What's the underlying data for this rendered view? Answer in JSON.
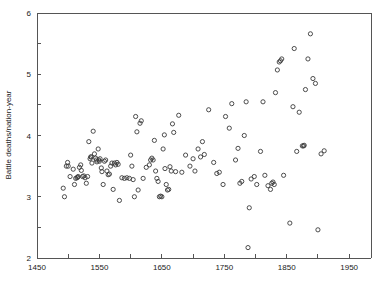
{
  "figure": {
    "background": "#ffffff",
    "marker_color": "#3a3a3a",
    "axis_color": "#555555",
    "ylabel": "Battle deaths/nation-year",
    "xlabel": ""
  },
  "chart_data": {
    "type": "scatter",
    "title": "",
    "xlabel": "",
    "ylabel": "Battle deaths/nation-year",
    "xlim": [
      1450,
      1985
    ],
    "ylim": [
      2,
      6
    ],
    "grid": false,
    "legend": null,
    "marker": "open-circle",
    "xticks": [
      1450,
      1500,
      1550,
      1600,
      1650,
      1700,
      1750,
      1800,
      1850,
      1900,
      1950
    ],
    "xticklabels": [
      "1450",
      "",
      "1550",
      "",
      "1650",
      "",
      "1750",
      "",
      "1850",
      "",
      "1950"
    ],
    "yticks": [
      2,
      2.5,
      3,
      3.5,
      4,
      4.5,
      5,
      5.5,
      6
    ],
    "yticklabels": [
      "2",
      "",
      "3",
      "",
      "4",
      "",
      "5",
      "",
      "6"
    ],
    "points": [
      [
        1492,
        3.14
      ],
      [
        1494,
        3.0
      ],
      [
        1497,
        3.5
      ],
      [
        1499,
        3.56
      ],
      [
        1500,
        3.5
      ],
      [
        1503,
        3.33
      ],
      [
        1508,
        3.45
      ],
      [
        1510,
        3.2
      ],
      [
        1512,
        3.3
      ],
      [
        1514,
        3.31
      ],
      [
        1515,
        3.32
      ],
      [
        1516,
        3.33
      ],
      [
        1518,
        3.48
      ],
      [
        1520,
        3.52
      ],
      [
        1521,
        3.43
      ],
      [
        1523,
        3.33
      ],
      [
        1525,
        3.34
      ],
      [
        1527,
        3.31
      ],
      [
        1529,
        3.22
      ],
      [
        1531,
        3.33
      ],
      [
        1533,
        3.9
      ],
      [
        1535,
        3.62
      ],
      [
        1536,
        3.65
      ],
      [
        1537,
        3.65
      ],
      [
        1538,
        3.55
      ],
      [
        1540,
        4.07
      ],
      [
        1542,
        3.7
      ],
      [
        1544,
        3.63
      ],
      [
        1545,
        3.6
      ],
      [
        1546,
        3.57
      ],
      [
        1548,
        3.78
      ],
      [
        1549,
        3.6
      ],
      [
        1550,
        3.58
      ],
      [
        1551,
        3.62
      ],
      [
        1553,
        3.47
      ],
      [
        1554,
        3.41
      ],
      [
        1556,
        3.2
      ],
      [
        1558,
        3.58
      ],
      [
        1560,
        3.6
      ],
      [
        1562,
        3.42
      ],
      [
        1564,
        3.36
      ],
      [
        1566,
        3.37
      ],
      [
        1568,
        3.5
      ],
      [
        1570,
        3.55
      ],
      [
        1572,
        3.12
      ],
      [
        1574,
        3.55
      ],
      [
        1576,
        3.52
      ],
      [
        1578,
        3.56
      ],
      [
        1580,
        3.53
      ],
      [
        1582,
        2.94
      ],
      [
        1586,
        3.31
      ],
      [
        1590,
        3.3
      ],
      [
        1594,
        3.31
      ],
      [
        1598,
        3.3
      ],
      [
        1600,
        3.68
      ],
      [
        1602,
        3.5
      ],
      [
        1604,
        3.28
      ],
      [
        1606,
        3.0
      ],
      [
        1608,
        4.31
      ],
      [
        1610,
        4.06
      ],
      [
        1612,
        3.11
      ],
      [
        1615,
        4.2
      ],
      [
        1617,
        4.24
      ],
      [
        1620,
        3.3
      ],
      [
        1625,
        3.48
      ],
      [
        1630,
        3.52
      ],
      [
        1632,
        3.6
      ],
      [
        1634,
        3.63
      ],
      [
        1636,
        3.6
      ],
      [
        1638,
        3.92
      ],
      [
        1640,
        3.42
      ],
      [
        1642,
        3.3
      ],
      [
        1644,
        3.25
      ],
      [
        1646,
        3.0
      ],
      [
        1648,
        3.01
      ],
      [
        1650,
        3.0
      ],
      [
        1652,
        3.78
      ],
      [
        1654,
        4.01
      ],
      [
        1655,
        3.46
      ],
      [
        1657,
        3.2
      ],
      [
        1659,
        3.11
      ],
      [
        1661,
        3.12
      ],
      [
        1663,
        3.49
      ],
      [
        1665,
        3.42
      ],
      [
        1667,
        4.19
      ],
      [
        1669,
        4.05
      ],
      [
        1672,
        3.41
      ],
      [
        1677,
        4.33
      ],
      [
        1682,
        3.4
      ],
      [
        1688,
        3.68
      ],
      [
        1695,
        3.5
      ],
      [
        1700,
        3.62
      ],
      [
        1703,
        3.42
      ],
      [
        1708,
        3.78
      ],
      [
        1712,
        3.65
      ],
      [
        1715,
        3.9
      ],
      [
        1718,
        3.69
      ],
      [
        1725,
        4.42
      ],
      [
        1733,
        3.56
      ],
      [
        1738,
        3.38
      ],
      [
        1742,
        3.4
      ],
      [
        1748,
        3.2
      ],
      [
        1752,
        4.31
      ],
      [
        1758,
        4.12
      ],
      [
        1762,
        4.52
      ],
      [
        1768,
        3.6
      ],
      [
        1772,
        3.79
      ],
      [
        1775,
        3.22
      ],
      [
        1778,
        3.25
      ],
      [
        1782,
        4.0
      ],
      [
        1785,
        4.55
      ],
      [
        1788,
        2.17
      ],
      [
        1790,
        2.82
      ],
      [
        1793,
        3.29
      ],
      [
        1798,
        3.33
      ],
      [
        1802,
        3.2
      ],
      [
        1808,
        3.74
      ],
      [
        1812,
        4.55
      ],
      [
        1815,
        3.35
      ],
      [
        1820,
        3.18
      ],
      [
        1824,
        3.12
      ],
      [
        1826,
        3.22
      ],
      [
        1828,
        3.24
      ],
      [
        1830,
        3.2
      ],
      [
        1832,
        4.7
      ],
      [
        1835,
        5.07
      ],
      [
        1838,
        5.2
      ],
      [
        1840,
        5.22
      ],
      [
        1842,
        5.25
      ],
      [
        1845,
        3.35
      ],
      [
        1855,
        2.57
      ],
      [
        1860,
        4.47
      ],
      [
        1862,
        5.42
      ],
      [
        1866,
        3.74
      ],
      [
        1870,
        4.38
      ],
      [
        1875,
        3.83
      ],
      [
        1877,
        3.83
      ],
      [
        1878,
        3.84
      ],
      [
        1880,
        4.75
      ],
      [
        1884,
        5.25
      ],
      [
        1888,
        5.66
      ],
      [
        1892,
        4.93
      ],
      [
        1896,
        4.85
      ],
      [
        1900,
        2.46
      ],
      [
        1905,
        3.7
      ],
      [
        1910,
        3.75
      ]
    ]
  }
}
